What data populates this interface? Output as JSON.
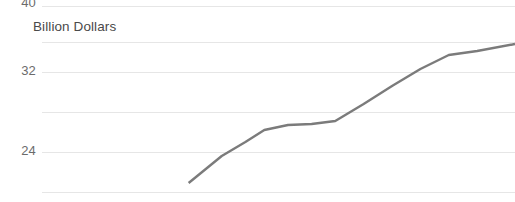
{
  "chart_data": {
    "type": "line",
    "title": "",
    "subtitle": "",
    "xlabel": "",
    "ylabel": "Billion Dollars",
    "ylim": [
      20,
      40
    ],
    "xlim": [
      0,
      100
    ],
    "grid": true,
    "legend_position": "none",
    "y_ticks": [
      {
        "label": "40",
        "value": 40
      },
      {
        "label": "32",
        "value": 32
      },
      {
        "label": "24",
        "value": 24
      }
    ],
    "x_ticks": [],
    "series": [
      {
        "name": "Billion Dollars",
        "color": "#7b7b7b",
        "x": [
          31.0,
          38.0,
          43.0,
          47.0,
          52.0,
          57.0,
          62.0,
          68.0,
          74.0,
          80.0,
          86.0,
          92.0,
          100.0
        ],
        "values": [
          20.5,
          23.2,
          24.6,
          25.8,
          26.3,
          26.4,
          26.7,
          28.4,
          30.2,
          31.9,
          33.3,
          33.7,
          34.4
        ]
      }
    ],
    "annotations": [],
    "note": "Cropped view of a line chart; topmost tick label is clipped by the top edge."
  },
  "axis": {
    "y_title": "Billion Dollars"
  }
}
